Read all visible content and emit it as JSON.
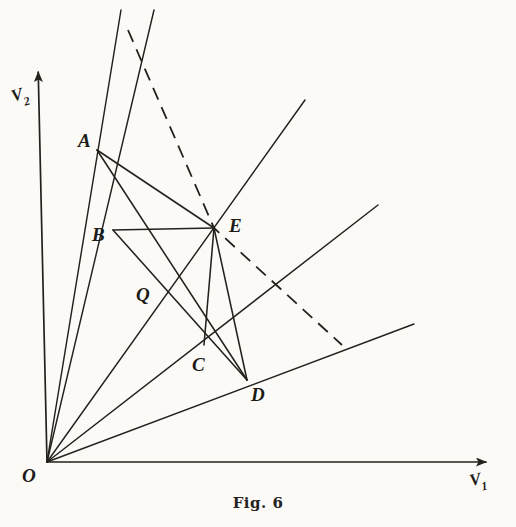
{
  "figure": {
    "caption": "Fig. 6",
    "background_color": "#fbfaf7",
    "ink_color": "#24211d",
    "axes": {
      "x_label_main": "V",
      "x_label_sub": "1",
      "y_label_main": "V",
      "y_label_sub": "2",
      "origin_label": "O",
      "x_axis": {
        "from": [
          47,
          462
        ],
        "to": [
          492,
          462
        ],
        "arrow": true
      },
      "y_axis": {
        "from": [
          47,
          462
        ],
        "to": [
          38,
          62
        ],
        "arrow": true
      }
    },
    "points": [
      {
        "id": "O",
        "label": "O",
        "x": 47,
        "y": 462,
        "label_x": 22,
        "label_y": 466
      },
      {
        "id": "A",
        "label": "A",
        "x": 97,
        "y": 150,
        "label_x": 78,
        "label_y": 131
      },
      {
        "id": "B",
        "label": "B",
        "x": 113,
        "y": 230,
        "label_x": 92,
        "label_y": 225
      },
      {
        "id": "Q",
        "label": "Q",
        "x": 162,
        "y": 297,
        "label_x": 136,
        "label_y": 285
      },
      {
        "id": "E",
        "label": "E",
        "x": 214,
        "y": 228,
        "label_x": 229,
        "label_y": 216
      },
      {
        "id": "C",
        "label": "C",
        "x": 204,
        "y": 345,
        "label_x": 192,
        "label_y": 355
      },
      {
        "id": "D",
        "label": "D",
        "x": 247,
        "y": 380,
        "label_x": 251,
        "label_y": 385
      }
    ],
    "rays_from_origin": [
      {
        "name": "ray-1-steepest",
        "to": [
          121,
          10
        ]
      },
      {
        "name": "ray-2",
        "to": [
          154,
          10
        ]
      },
      {
        "name": "ray-3",
        "to": [
          305,
          100
        ]
      },
      {
        "name": "ray-4",
        "to": [
          378,
          205
        ]
      },
      {
        "name": "ray-5-shallowest",
        "to": [
          414,
          324
        ]
      }
    ],
    "solid_segments": [
      {
        "name": "segment-A-E",
        "from": [
          97,
          150
        ],
        "to": [
          214,
          228
        ]
      },
      {
        "name": "segment-A-D",
        "from": [
          97,
          150
        ],
        "to": [
          247,
          380
        ]
      },
      {
        "name": "segment-E-D",
        "from": [
          214,
          228
        ],
        "to": [
          247,
          380
        ]
      },
      {
        "name": "segment-E-C",
        "from": [
          214,
          228
        ],
        "to": [
          204,
          345
        ]
      },
      {
        "name": "segment-B-E",
        "from": [
          113,
          230
        ],
        "to": [
          214,
          228
        ]
      },
      {
        "name": "segment-B-D",
        "from": [
          113,
          230
        ],
        "to": [
          247,
          380
        ]
      }
    ],
    "dashed_polyline": {
      "name": "dashed-boundary",
      "points": [
        [
          128,
          30
        ],
        [
          214,
          228
        ],
        [
          342,
          345
        ]
      ]
    }
  }
}
